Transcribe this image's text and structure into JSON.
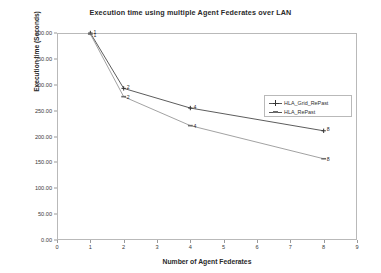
{
  "chart_data": {
    "type": "line",
    "title": "Execution time using multiple Agent Federates over LAN",
    "xlabel": "Number of Agent Federates",
    "ylabel": "Execution time (Seconds)",
    "xlim": [
      0,
      9
    ],
    "ylim": [
      0,
      400
    ],
    "grid": false,
    "legend_position": "center-right",
    "x_ticks": [
      "0",
      "1",
      "2",
      "3",
      "4",
      "5",
      "6",
      "7",
      "8",
      "9"
    ],
    "x_tick_values": [
      0,
      1,
      2,
      3,
      4,
      5,
      6,
      7,
      8,
      9
    ],
    "y_ticks": [
      "0.00",
      "50.00",
      "100.00",
      "150.00",
      "200.00",
      "250.00",
      "300.00",
      "350.00",
      "400.00"
    ],
    "y_tick_values": [
      0,
      50,
      100,
      150,
      200,
      250,
      300,
      350,
      400
    ],
    "x": [
      1,
      2,
      4,
      8
    ],
    "series": [
      {
        "name": "HLA_Grid_RePast",
        "marker": "plus",
        "color": "#4a4a4a",
        "values": [
          400,
          293,
          255,
          211
        ],
        "point_labels": [
          "1",
          "2",
          "4",
          "8"
        ]
      },
      {
        "name": "HLA_RePast",
        "marker": "dash",
        "color": "#8a8a8a",
        "values": [
          398,
          277,
          221,
          157
        ],
        "point_labels": [
          "1",
          "2",
          "4",
          "8"
        ]
      }
    ]
  },
  "legend": {
    "items": [
      {
        "label": "HLA_Grid_RePast"
      },
      {
        "label": "HLA_RePast"
      }
    ]
  },
  "colors": {
    "frame": "#b9b9b9",
    "series_1": "#4a4a4a",
    "series_2": "#8a8a8a",
    "text": "#2a2a2a",
    "background": "#ffffff"
  }
}
